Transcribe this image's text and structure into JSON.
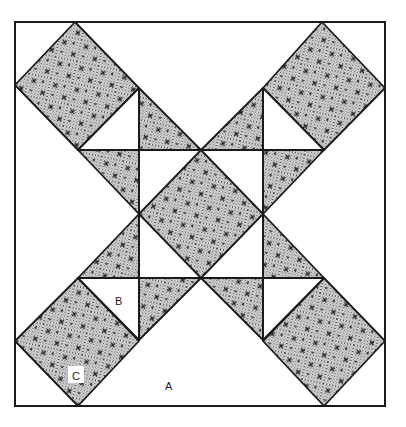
{
  "diagram": {
    "title": "",
    "type": "quilt-block-pattern",
    "colors": {
      "background": "#ffffff",
      "line": "#1a1a1a",
      "shade": "#c8c8c8",
      "shade_dots": "#555555",
      "cross_marks": "#222222"
    },
    "labels": {
      "a": "A",
      "b": "B",
      "c": "C"
    },
    "pieces": [
      {
        "id": "corner-square-top-left",
        "shape": "square",
        "shaded": true
      },
      {
        "id": "corner-square-top-right",
        "shape": "square",
        "shaded": true
      },
      {
        "id": "corner-square-bottom-left",
        "shape": "square",
        "shaded": true
      },
      {
        "id": "corner-square-bottom-right",
        "shape": "square",
        "shaded": true
      },
      {
        "id": "center-diamond",
        "shape": "square",
        "shaded": true
      },
      {
        "id": "hourglass-triangles",
        "shape": "triangle",
        "shaded": "alternating"
      },
      {
        "id": "background-triangles",
        "shape": "triangle",
        "shaded": false,
        "label": "A"
      },
      {
        "id": "small-triangle",
        "shape": "triangle",
        "shaded": false,
        "label": "B"
      },
      {
        "id": "square-piece",
        "shape": "square",
        "shaded": true,
        "label": "C"
      }
    ]
  }
}
